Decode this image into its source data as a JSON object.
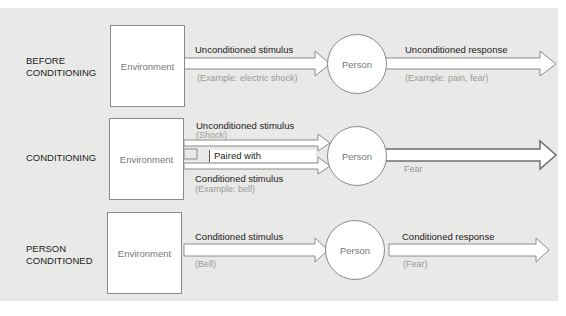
{
  "diagram": {
    "rows": [
      {
        "label": "BEFORE\nCONDITIONING",
        "label_line1": "BEFORE",
        "label_line2": "CONDITIONING",
        "environment": "Environment",
        "stimulus_label": "Unconditioned stimulus",
        "stimulus_example": "(Example: electric shock)",
        "person": "Person",
        "response_label": "Unconditioned response",
        "response_example": "(Example: pain, fear)"
      },
      {
        "label_line1": "CONDITIONING",
        "environment": "Environment",
        "stimulus1_label": "Unconditioned stimulus",
        "stimulus1_example": "(Shock)",
        "paired_label": "Paired with",
        "stimulus2_label": "Conditioned stimulus",
        "stimulus2_example": "(Example: bell)",
        "person": "Person",
        "response_example": "Fear"
      },
      {
        "label_line1": "PERSON",
        "label_line2": "CONDITIONED",
        "environment": "Environment",
        "stimulus_label": "Conditioned stimulus",
        "stimulus_example": "(Bell)",
        "person": "Person",
        "response_label": "Conditioned response",
        "response_example": "(Fear)"
      }
    ],
    "colors": {
      "panel": "#e9e9e7",
      "box_fill": "#ffffff",
      "stroke": "#8a8a8a",
      "text": "#222222",
      "subtext": "#999999"
    }
  }
}
